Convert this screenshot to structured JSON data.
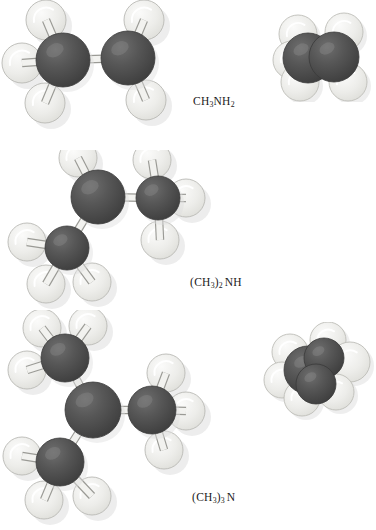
{
  "figure": {
    "background_color": "#ffffff",
    "atom_colors": {
      "carbon_nitrogen_dark": "#4a4a4a",
      "hydrogen_light": "#e6e6e3",
      "bond_stick": "#f2f2ef",
      "outline": "#6b6b6b",
      "shadow": "#dedede"
    },
    "rows": [
      {
        "id": "methylamine",
        "formula_parts": {
          "prefix": "CH",
          "sub1": "3",
          "mid": "NH",
          "sub2": "2",
          "suffix": ""
        },
        "formula_plain": "CH3NH2",
        "label_x": 193,
        "label_y": 96,
        "ball_stick": {
          "name": "ball-and-stick-model-methylamine",
          "heavy_atoms": [
            {
              "id": "C",
              "cx": 63,
              "cy": 60,
              "r": 27
            },
            {
              "id": "N",
              "cx": 128,
              "cy": 58,
              "r": 27
            }
          ],
          "hydrogens": [
            {
              "cx": 46,
              "cy": 20,
              "r": 20
            },
            {
              "cx": 22,
              "cy": 63,
              "r": 20
            },
            {
              "cx": 45,
              "cy": 103,
              "r": 20
            },
            {
              "cx": 144,
              "cy": 20,
              "r": 20
            },
            {
              "cx": 146,
              "cy": 100,
              "r": 20
            }
          ],
          "bonds": [
            {
              "x1": 63,
              "y1": 60,
              "x2": 46,
              "y2": 20
            },
            {
              "x1": 63,
              "y1": 60,
              "x2": 22,
              "y2": 63
            },
            {
              "x1": 63,
              "y1": 60,
              "x2": 45,
              "y2": 103
            },
            {
              "x1": 63,
              "y1": 60,
              "x2": 128,
              "y2": 58
            },
            {
              "x1": 128,
              "y1": 58,
              "x2": 144,
              "y2": 20
            },
            {
              "x1": 128,
              "y1": 58,
              "x2": 146,
              "y2": 100
            }
          ]
        },
        "space_fill": {
          "name": "space-filling-model-methylamine",
          "x": 272,
          "y": 12,
          "w": 104,
          "h": 90,
          "spheres": [
            {
              "cx": 26,
              "cy": 22,
              "r": 19,
              "type": "H"
            },
            {
              "cx": 20,
              "cy": 48,
              "r": 19,
              "type": "H"
            },
            {
              "cx": 28,
              "cy": 70,
              "r": 19,
              "type": "H"
            },
            {
              "cx": 72,
              "cy": 20,
              "r": 19,
              "type": "H"
            },
            {
              "cx": 76,
              "cy": 70,
              "r": 19,
              "type": "H"
            },
            {
              "cx": 36,
              "cy": 46,
              "r": 25,
              "type": "C"
            },
            {
              "cx": 62,
              "cy": 45,
              "r": 25,
              "type": "N"
            }
          ]
        }
      },
      {
        "id": "dimethylamine",
        "formula_parts": {
          "prefix": "(CH",
          "sub1": "3",
          "mid": ")",
          "sub2": "2",
          "suffix": "NH"
        },
        "formula_plain": "(CH3)2NH",
        "label_x": 190,
        "label_y": 277,
        "ball_stick": {
          "name": "ball-and-stick-model-dimethylamine",
          "heavy_atoms": [
            {
              "id": "N",
              "cx": 98,
              "cy": 47,
              "r": 27
            },
            {
              "id": "C1",
              "cx": 158,
              "cy": 48,
              "r": 22
            },
            {
              "id": "C2",
              "cx": 67,
              "cy": 98,
              "r": 22
            }
          ],
          "hydrogens": [
            {
              "cx": 78,
              "cy": 8,
              "r": 19
            },
            {
              "cx": 152,
              "cy": 10,
              "r": 19
            },
            {
              "cx": 186,
              "cy": 48,
              "r": 19
            },
            {
              "cx": 160,
              "cy": 90,
              "r": 19
            },
            {
              "cx": 27,
              "cy": 92,
              "r": 19
            },
            {
              "cx": 46,
              "cy": 134,
              "r": 19
            },
            {
              "cx": 92,
              "cy": 132,
              "r": 19
            }
          ],
          "bonds": [
            {
              "x1": 98,
              "y1": 47,
              "x2": 78,
              "y2": 8
            },
            {
              "x1": 98,
              "y1": 47,
              "x2": 158,
              "y2": 48
            },
            {
              "x1": 98,
              "y1": 47,
              "x2": 67,
              "y2": 98
            },
            {
              "x1": 158,
              "y1": 48,
              "x2": 152,
              "y2": 10
            },
            {
              "x1": 158,
              "y1": 48,
              "x2": 186,
              "y2": 48
            },
            {
              "x1": 158,
              "y1": 48,
              "x2": 160,
              "y2": 90
            },
            {
              "x1": 67,
              "y1": 98,
              "x2": 27,
              "y2": 92
            },
            {
              "x1": 67,
              "y1": 98,
              "x2": 46,
              "y2": 134
            },
            {
              "x1": 67,
              "y1": 98,
              "x2": 92,
              "y2": 132
            }
          ]
        },
        "space_fill": {
          "name": "space-filling-model-dimethylamine",
          "x": 262,
          "y": 172,
          "w": 114,
          "h": 98,
          "spheres": [
            {
              "cx": 28,
              "cy": 30,
              "r": 18,
              "type": "H"
            },
            {
              "cx": 20,
              "cy": 58,
              "r": 18,
              "type": "H"
            },
            {
              "cx": 40,
              "cy": 76,
              "r": 18,
              "type": "H"
            },
            {
              "cx": 66,
              "cy": 18,
              "r": 18,
              "type": "H"
            },
            {
              "cx": 88,
              "cy": 40,
              "r": 20,
              "type": "H"
            },
            {
              "cx": 74,
              "cy": 70,
              "r": 18,
              "type": "H"
            },
            {
              "cx": 46,
              "cy": 48,
              "r": 24,
              "type": "N"
            },
            {
              "cx": 62,
              "cy": 36,
              "r": 20,
              "type": "C"
            },
            {
              "cx": 54,
              "cy": 62,
              "r": 20,
              "type": "C"
            }
          ]
        }
      },
      {
        "id": "trimethylamine",
        "formula_parts": {
          "prefix": "(CH",
          "sub1": "3",
          "mid": ")",
          "sub2": "3",
          "suffix": "N"
        },
        "formula_plain": "(CH3)3N",
        "label_x": 192,
        "label_y": 492,
        "ball_stick": {
          "name": "ball-and-stick-model-trimethylamine",
          "heavy_atoms": [
            {
              "id": "N",
              "cx": 93,
              "cy": 100,
              "r": 28
            },
            {
              "id": "C1",
              "cx": 65,
              "cy": 48,
              "r": 24
            },
            {
              "id": "C2",
              "cx": 152,
              "cy": 100,
              "r": 24
            },
            {
              "id": "C3",
              "cx": 60,
              "cy": 152,
              "r": 24
            }
          ],
          "hydrogens": [
            {
              "cx": 42,
              "cy": 18,
              "r": 19
            },
            {
              "cx": 88,
              "cy": 16,
              "r": 19
            },
            {
              "cx": 27,
              "cy": 60,
              "r": 19
            },
            {
              "cx": 166,
              "cy": 63,
              "r": 19
            },
            {
              "cx": 186,
              "cy": 101,
              "r": 19
            },
            {
              "cx": 164,
              "cy": 140,
              "r": 19
            },
            {
              "cx": 22,
              "cy": 146,
              "r": 19
            },
            {
              "cx": 44,
              "cy": 190,
              "r": 19
            },
            {
              "cx": 92,
              "cy": 186,
              "r": 19
            }
          ],
          "bonds": [
            {
              "x1": 93,
              "y1": 100,
              "x2": 65,
              "y2": 48
            },
            {
              "x1": 93,
              "y1": 100,
              "x2": 152,
              "y2": 100
            },
            {
              "x1": 93,
              "y1": 100,
              "x2": 60,
              "y2": 152
            },
            {
              "x1": 65,
              "y1": 48,
              "x2": 42,
              "y2": 18
            },
            {
              "x1": 65,
              "y1": 48,
              "x2": 88,
              "y2": 16
            },
            {
              "x1": 65,
              "y1": 48,
              "x2": 27,
              "y2": 60
            },
            {
              "x1": 152,
              "y1": 100,
              "x2": 166,
              "y2": 63
            },
            {
              "x1": 152,
              "y1": 100,
              "x2": 186,
              "y2": 101
            },
            {
              "x1": 152,
              "y1": 100,
              "x2": 164,
              "y2": 140
            },
            {
              "x1": 60,
              "y1": 152,
              "x2": 22,
              "y2": 146
            },
            {
              "x1": 60,
              "y1": 152,
              "x2": 44,
              "y2": 190
            },
            {
              "x1": 60,
              "y1": 152,
              "x2": 92,
              "y2": 186
            }
          ]
        },
        "space_fill": {
          "name": "space-filling-model-trimethylamine",
          "x": 256,
          "y": 372,
          "w": 120,
          "h": 118,
          "spheres": [
            {
              "cx": 26,
              "cy": 42,
              "r": 18,
              "type": "H"
            },
            {
              "cx": 22,
              "cy": 72,
              "r": 18,
              "type": "H"
            },
            {
              "cx": 40,
              "cy": 94,
              "r": 18,
              "type": "H"
            },
            {
              "cx": 46,
              "cy": 18,
              "r": 18,
              "type": "H"
            },
            {
              "cx": 76,
              "cy": 24,
              "r": 18,
              "type": "H"
            },
            {
              "cx": 96,
              "cy": 52,
              "r": 20,
              "type": "H"
            },
            {
              "cx": 86,
              "cy": 84,
              "r": 18,
              "type": "H"
            },
            {
              "cx": 58,
              "cy": 104,
              "r": 18,
              "type": "H"
            },
            {
              "cx": 54,
              "cy": 58,
              "r": 25,
              "type": "N"
            },
            {
              "cx": 48,
              "cy": 38,
              "r": 20,
              "type": "C"
            },
            {
              "cx": 74,
              "cy": 50,
              "r": 20,
              "type": "C"
            },
            {
              "cx": 56,
              "cy": 78,
              "r": 20,
              "type": "C"
            }
          ]
        }
      }
    ]
  }
}
